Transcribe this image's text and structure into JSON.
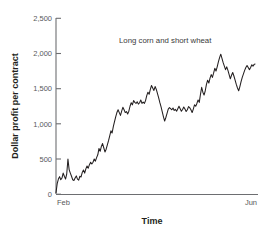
{
  "chart_data": {
    "type": "line",
    "title": "",
    "subtitle": "",
    "xlabel": "Time",
    "ylabel": "Dollar profit per contract",
    "annotation": "Long corn and short wheat",
    "grid": false,
    "legend": "none",
    "ylim": [
      0,
      2500
    ],
    "yticks": [
      0,
      500,
      1000,
      1500,
      2000,
      2500
    ],
    "ytick_labels": [
      "0",
      "500",
      "1,000",
      "1,500",
      "2,000",
      "2,500"
    ],
    "xtick_labels": [
      "Feb",
      "Jun"
    ],
    "xlim_labels": [
      "Feb",
      "Jun"
    ],
    "series": [
      {
        "name": "Long corn and short wheat",
        "color": "#231f20",
        "x": [
          0.0,
          0.6,
          1.2,
          1.8,
          2.4,
          3.0,
          3.6,
          4.2,
          4.8,
          5.4,
          6.0,
          6.6,
          7.2,
          7.8,
          8.4,
          9.0,
          9.6,
          10.2,
          10.8,
          11.4,
          12.0,
          12.6,
          13.2,
          13.8,
          14.4,
          15.0,
          15.6,
          16.2,
          16.8,
          17.4,
          18.0,
          18.6,
          19.2,
          19.8,
          20.4,
          21.0,
          21.6,
          22.2,
          22.8,
          23.4,
          24.0,
          24.6,
          25.2,
          25.8,
          26.4,
          27.0,
          27.6,
          28.2,
          28.8,
          29.4,
          30.0,
          30.6,
          31.2,
          31.8,
          32.4,
          33.0,
          33.6,
          34.2,
          34.8,
          35.4,
          36.0,
          36.6,
          37.2,
          37.8,
          38.4,
          39.0,
          39.6,
          40.2,
          40.8,
          41.4,
          42.0,
          42.6,
          43.2,
          43.8,
          44.4,
          45.0,
          45.6,
          46.2,
          46.8,
          47.4,
          48.0,
          48.6,
          49.2,
          49.8,
          50.4,
          51.0,
          51.6,
          52.2,
          52.8,
          53.4,
          54.0,
          54.6,
          55.2,
          55.8,
          56.4,
          57.0,
          57.6,
          58.2,
          58.8,
          59.4,
          60.0,
          60.6,
          61.2,
          61.8,
          62.4,
          63.0,
          63.6,
          64.2,
          64.8,
          65.4,
          66.0,
          66.6,
          67.2,
          67.8,
          68.4,
          69.0,
          69.6,
          70.2,
          70.8,
          71.4,
          72.0,
          72.6,
          73.2,
          73.8,
          74.4,
          75.0,
          75.6,
          76.2,
          76.8,
          77.4,
          78.0,
          78.6,
          79.2,
          79.8,
          80.4,
          81.0,
          81.6,
          82.2,
          82.8,
          83.4,
          84.0,
          84.6,
          85.2,
          85.8,
          86.4,
          87.0,
          87.6,
          88.2,
          88.8,
          89.4,
          90.0,
          90.6,
          91.2,
          91.8,
          92.4,
          93.0,
          93.6,
          94.2,
          94.8,
          95.4,
          96.0,
          96.6,
          97.2,
          97.8,
          98.4,
          99.0,
          99.6,
          100.0
        ],
        "y": [
          20,
          150,
          215,
          250,
          205,
          230,
          300,
          255,
          215,
          290,
          500,
          350,
          300,
          255,
          205,
          195,
          230,
          260,
          215,
          200,
          255,
          245,
          310,
          345,
          300,
          360,
          400,
          370,
          420,
          455,
          430,
          455,
          500,
          470,
          520,
          560,
          650,
          610,
          680,
          720,
          660,
          600,
          640,
          700,
          760,
          830,
          900,
          870,
          960,
          1030,
          1100,
          1160,
          1200,
          1160,
          1120,
          1180,
          1235,
          1200,
          1160,
          1175,
          1140,
          1180,
          1250,
          1300,
          1270,
          1330,
          1305,
          1290,
          1315,
          1280,
          1300,
          1340,
          1290,
          1310,
          1290,
          1330,
          1400,
          1450,
          1420,
          1490,
          1545,
          1510,
          1475,
          1530,
          1490,
          1430,
          1370,
          1300,
          1240,
          1170,
          1100,
          1040,
          1090,
          1150,
          1210,
          1230,
          1215,
          1200,
          1225,
          1190,
          1205,
          1180,
          1215,
          1250,
          1215,
          1180,
          1205,
          1240,
          1210,
          1175,
          1200,
          1245,
          1230,
          1200,
          1160,
          1210,
          1270,
          1250,
          1290,
          1340,
          1305,
          1420,
          1520,
          1450,
          1410,
          1470,
          1560,
          1620,
          1580,
          1650,
          1700,
          1660,
          1720,
          1790,
          1750,
          1810,
          1880,
          1940,
          1990,
          1930,
          1870,
          1820,
          1770,
          1810,
          1760,
          1700,
          1640,
          1690,
          1730,
          1680,
          1620,
          1560,
          1510,
          1470,
          1530,
          1600,
          1660,
          1710,
          1760,
          1800,
          1830,
          1800,
          1770,
          1800,
          1840,
          1820,
          1845,
          1850
        ]
      }
    ]
  },
  "axis": {
    "y_title": "Dollar profit per contract",
    "x_title": "Time",
    "y_labels": [
      "2,500",
      "2,000",
      "1,500",
      "1,000",
      "500",
      "0"
    ],
    "x_left_label": "Feb",
    "x_right_label": "Jun"
  },
  "annotation": {
    "text": "Long corn and short wheat"
  },
  "colors": {
    "line": "#231f20",
    "axis": "#6d6e71",
    "tick_text": "#58595b",
    "title_text": "#231f20",
    "background": "#ffffff"
  }
}
